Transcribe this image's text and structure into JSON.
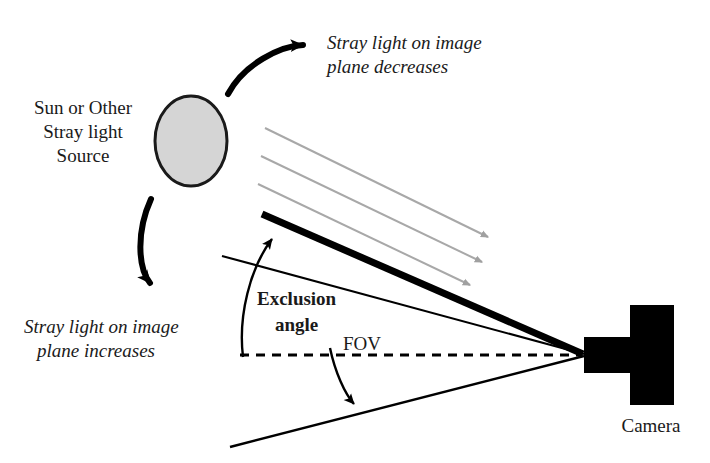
{
  "figure": {
    "kind": "optical-stray-light-exclusion-angle-diagram",
    "background_color": "#ffffff",
    "ink_color": "#000000",
    "ray_color": "#a8a8a8",
    "sun_fill_color": "#d5d5d5",
    "sun_outline_color": "#1a1a1a"
  },
  "labels": {
    "source": {
      "line1": "Sun or Other",
      "line2": "Stray light",
      "line3": "Source"
    },
    "decrease_note": {
      "line1": "Stray light on image",
      "line2": "plane decreases"
    },
    "increase_note": {
      "line1": "Stray light on image",
      "line2": "plane increases"
    },
    "exclusion_angle": {
      "line1": "Exclusion",
      "line2": "angle"
    },
    "fov": "FOV",
    "camera": "Camera"
  },
  "elements": {
    "sun": {
      "name": "stray-light-source",
      "cx": 191,
      "cy": 141,
      "rx": 36,
      "ry": 45
    },
    "camera": {
      "name": "camera",
      "lens": {
        "x": 584,
        "y": 337,
        "w": 46,
        "h": 36
      },
      "body": {
        "x": 630,
        "y": 305,
        "w": 44,
        "h": 100
      },
      "vertex_x": 585,
      "vertex_y": 355
    },
    "stray_rays": [
      {
        "x1": 265,
        "y1": 128,
        "x2": 488,
        "y2": 237
      },
      {
        "x1": 261,
        "y1": 156,
        "x2": 482,
        "y2": 262
      },
      {
        "x1": 258,
        "y1": 184,
        "x2": 470,
        "y2": 285
      }
    ],
    "exclusion_boundary": {
      "x1": 262,
      "y1": 214,
      "x2": 583,
      "y2": 354
    },
    "fov_upper_edge": {
      "x1": 222,
      "y1": 256,
      "x2": 584,
      "y2": 354
    },
    "fov_lower_edge": {
      "x1": 230,
      "y1": 447,
      "x2": 584,
      "y2": 356
    },
    "boresight_dashed_axis": {
      "x1": 240,
      "y1": 355,
      "x2": 582,
      "y2": 355
    },
    "curved_arrow_up": {
      "from_x": 228,
      "from_y": 94,
      "to_x": 311,
      "to_y": 47
    },
    "curved_arrow_down": {
      "from_x": 151,
      "from_y": 199,
      "to_x": 156,
      "to_y": 289
    },
    "exclusion_angle_arc": {
      "from_x": 243,
      "from_y": 357,
      "to_x": 277,
      "to_y": 233
    },
    "fov_angle_arc": {
      "from_x": 330,
      "from_y": 350,
      "to_x": 357,
      "to_y": 409
    }
  }
}
